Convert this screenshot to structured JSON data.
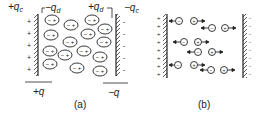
{
  "figure_a": {
    "caption": "(a)",
    "labels": {
      "plus_qc": "+q",
      "plus_qc_sub": "c",
      "minus_qd": "−q",
      "minus_qd_sub": "d",
      "plus_qd": "+q",
      "plus_qd_sub": "d",
      "minus_qc": "−q",
      "minus_qc_sub": "c",
      "plus_q": "+q",
      "minus_q": "−q"
    },
    "dipole_text": "− +"
  },
  "figure_b": {
    "caption": "(b)",
    "neg_ion": "−",
    "pos_ion": "+"
  }
}
